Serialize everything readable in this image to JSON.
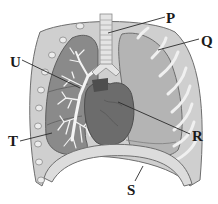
{
  "diagram": {
    "labels": [
      {
        "id": "P",
        "text": "P",
        "x": 166,
        "y": 23,
        "line": [
          108,
          33,
          165,
          17
        ]
      },
      {
        "id": "Q",
        "text": "Q",
        "x": 201,
        "y": 46,
        "line": [
          158,
          50,
          199,
          39
        ]
      },
      {
        "id": "U",
        "text": "U",
        "x": 10,
        "y": 67,
        "line": [
          22,
          60,
          80,
          88
        ]
      },
      {
        "id": "R",
        "text": "R",
        "x": 192,
        "y": 141,
        "line": [
          118,
          102,
          190,
          134
        ]
      },
      {
        "id": "T",
        "text": "T",
        "x": 8,
        "y": 146,
        "line": [
          20,
          141,
          52,
          133
        ]
      },
      {
        "id": "S",
        "text": "S",
        "x": 127,
        "y": 195,
        "line": [
          143,
          166,
          135,
          181
        ]
      }
    ],
    "colors": {
      "background": "#ffffff",
      "outline": "#6e6e6e",
      "lung_dark": "#8a8a8a",
      "lung_light": "#b4b4b4",
      "pleura": "#cfcfcf",
      "bronchi": "#f4f4f4",
      "heart": "#6c6c6c",
      "ribs": "#e8e8e8",
      "diaphragm": "#dcdcdc",
      "label": "#1a1a1a"
    }
  }
}
